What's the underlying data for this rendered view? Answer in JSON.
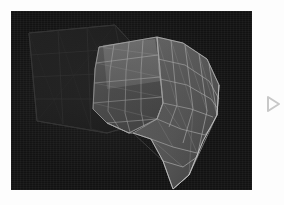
{
  "app": {
    "title": "3D Viewport",
    "background_color": "#fdfdfd"
  },
  "viewport": {
    "name": "3d-render-viewport",
    "background_color": "#141414",
    "frame_color": "#fdfdfd",
    "x": 11,
    "y": 11,
    "width": 241,
    "height": 179,
    "render_mode": "wireframe-shaded",
    "mesh": {
      "name": "deformed-cloth-surface",
      "wire_color": "#b9b9b9",
      "fill_color": "#5c5c5c",
      "fill_color_dark": "#3d3d3d",
      "topology": "quad",
      "quad_rows": 6,
      "quad_cols": 7
    },
    "ghost_mesh": {
      "name": "reference-cage",
      "wire_color": "#2e2e2e",
      "fill_color": "#1b1b1b",
      "topology": "quad",
      "quad_rows": 4,
      "quad_cols": 3
    }
  },
  "transport": {
    "play_label": "Play",
    "icon": "play-triangle-icon",
    "icon_color": "#c8c8c8"
  }
}
